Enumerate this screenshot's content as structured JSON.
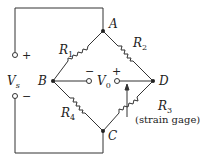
{
  "diagram": {
    "nodes": [
      {
        "id": "A",
        "label": "A"
      },
      {
        "id": "B",
        "label": "B"
      },
      {
        "id": "C",
        "label": "C"
      },
      {
        "id": "D",
        "label": "D"
      }
    ],
    "resistors": [
      {
        "id": "R1",
        "label": "R",
        "sub": "1",
        "between": [
          "A",
          "B"
        ]
      },
      {
        "id": "R2",
        "label": "R",
        "sub": "2",
        "between": [
          "A",
          "D"
        ]
      },
      {
        "id": "R3",
        "label": "R",
        "sub": "3",
        "between": [
          "D",
          "C"
        ],
        "note": "(strain gage)"
      },
      {
        "id": "R4",
        "label": "R",
        "sub": "4",
        "between": [
          "B",
          "C"
        ]
      }
    ],
    "source": {
      "label": "V",
      "sub": "s",
      "plus": "+",
      "minus": "−"
    },
    "output": {
      "label": "V",
      "sub": "0",
      "plus": "+",
      "minus": "−"
    }
  }
}
